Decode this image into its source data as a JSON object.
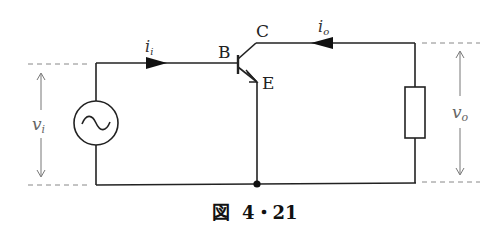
{
  "diagram": {
    "type": "common-emitter transistor small-signal circuit",
    "caption": {
      "prefix": "図",
      "number": "4・21"
    },
    "transistor": {
      "base_label": "B",
      "collector_label": "C",
      "emitter_label": "E"
    },
    "currents": {
      "input": {
        "symbol": "i",
        "subscript": "i",
        "direction": "right"
      },
      "output": {
        "symbol": "i",
        "subscript": "o",
        "direction": "left"
      }
    },
    "voltages": {
      "input": {
        "symbol": "v",
        "subscript": "i"
      },
      "output": {
        "symbol": "v",
        "subscript": "o"
      }
    },
    "components": {
      "source": "ac-voltage-source",
      "load": "resistor"
    },
    "colors": {
      "wire": "#222222",
      "dimension": "#777777",
      "background": "#ffffff"
    }
  }
}
